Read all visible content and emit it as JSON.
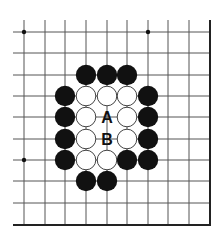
{
  "diagram": {
    "type": "go-board-fragment",
    "colors": {
      "background": "#ffffff",
      "grid_line": "#555555",
      "edge_line": "#222222",
      "black_stone": "#111111",
      "white_stone_fill": "#ffffff",
      "white_stone_stroke": "#444444",
      "star_point": "#111111"
    },
    "grid": {
      "columns_x": [
        24,
        45,
        65,
        86,
        107,
        127,
        148,
        168,
        189,
        210
      ],
      "rows_y": [
        32,
        53,
        75,
        96,
        117,
        139,
        160,
        181,
        203,
        225
      ],
      "open_left_x": 13,
      "open_top_y": 20,
      "right_edge": true,
      "bottom_edge": true
    },
    "star_points": [
      {
        "col": 0,
        "row": 0
      },
      {
        "col": 6,
        "row": 0
      },
      {
        "col": 0,
        "row": 6
      }
    ],
    "stones": [
      {
        "color": "black",
        "col": 3,
        "row": 2
      },
      {
        "color": "black",
        "col": 4,
        "row": 2
      },
      {
        "color": "black",
        "col": 5,
        "row": 2
      },
      {
        "color": "black",
        "col": 2,
        "row": 3
      },
      {
        "color": "white",
        "col": 3,
        "row": 3
      },
      {
        "color": "white",
        "col": 4,
        "row": 3
      },
      {
        "color": "white",
        "col": 5,
        "row": 3
      },
      {
        "color": "black",
        "col": 6,
        "row": 3
      },
      {
        "color": "black",
        "col": 2,
        "row": 4
      },
      {
        "color": "white",
        "col": 3,
        "row": 4
      },
      {
        "color": "white",
        "col": 5,
        "row": 4
      },
      {
        "color": "black",
        "col": 6,
        "row": 4
      },
      {
        "color": "black",
        "col": 2,
        "row": 5
      },
      {
        "color": "white",
        "col": 3,
        "row": 5
      },
      {
        "color": "white",
        "col": 5,
        "row": 5
      },
      {
        "color": "black",
        "col": 6,
        "row": 5
      },
      {
        "color": "black",
        "col": 2,
        "row": 6
      },
      {
        "color": "white",
        "col": 3,
        "row": 6
      },
      {
        "color": "white",
        "col": 4,
        "row": 6
      },
      {
        "color": "black",
        "col": 5,
        "row": 6
      },
      {
        "color": "black",
        "col": 6,
        "row": 6
      },
      {
        "color": "black",
        "col": 3,
        "row": 7
      },
      {
        "color": "black",
        "col": 4,
        "row": 7
      }
    ],
    "labels": [
      {
        "text": "A",
        "col": 4,
        "row": 4
      },
      {
        "text": "B",
        "col": 4,
        "row": 5
      }
    ]
  }
}
